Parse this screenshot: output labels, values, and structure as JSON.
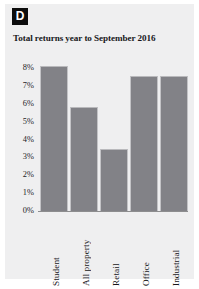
{
  "panel": {
    "label": "D",
    "background_color": "#efeff0",
    "badge_color": "#0d0d0d"
  },
  "chart_data": {
    "type": "bar",
    "title": "Total returns year to September 2016",
    "xlabel": "",
    "ylabel": "",
    "categories": [
      "Student",
      "All property",
      "Retail",
      "Office",
      "Industrial"
    ],
    "values": [
      7.7,
      5.5,
      3.3,
      7.15,
      7.15
    ],
    "ylim": [
      0,
      8
    ],
    "ytick_labels": [
      "8%",
      "7%",
      "6%",
      "5%",
      "4%",
      "3%",
      "2%",
      "1%",
      "0%"
    ],
    "ytick_values": [
      8,
      7,
      6,
      5,
      4,
      3,
      2,
      1,
      0
    ],
    "grid": false,
    "legend": false,
    "bar_color": "#828287",
    "value_unit": "%"
  },
  "yticks": {
    "t0": "8%",
    "t1": "7%",
    "t2": "6%",
    "t3": "5%",
    "t4": "4%",
    "t5": "3%",
    "t6": "2%",
    "t7": "1%",
    "t8": "0%"
  },
  "categories": {
    "c0": "Student",
    "c1": "All property",
    "c2": "Retail",
    "c3": "Office",
    "c4": "Industrial"
  }
}
